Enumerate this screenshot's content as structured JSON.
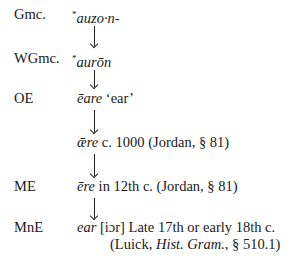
{
  "stages": [
    {
      "label": "Gmc.",
      "star": "*",
      "form": "auzo·n-"
    },
    {
      "label": "WGmc.",
      "star": "*",
      "form": "aurōn"
    },
    {
      "label": "OE",
      "form": "ēare",
      "gloss": "‘ear’"
    },
    {
      "label": "",
      "form": "ǣre",
      "note": "c. 1000 (Jordan, § 81)"
    },
    {
      "label": "ME",
      "form": "ēre",
      "note": "in 12th c. (Jordan, § 81)"
    },
    {
      "label": "MnE",
      "form": "ear",
      "note": "[iɔr] Late 17th or early 18th c.",
      "note2_open": "(Luick, ",
      "note2_italic": "Hist. Gram.",
      "note2_close": ", § 510.1)"
    }
  ]
}
